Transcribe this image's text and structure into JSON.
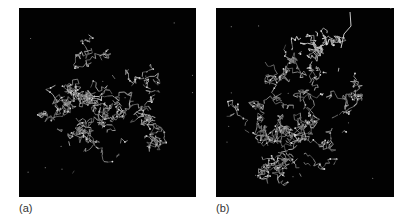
{
  "figure": {
    "background": "#ffffff",
    "panels": [
      {
        "id": "a",
        "label": "(a)",
        "description": "Protein structure stick model, compact globular fold",
        "box": {
          "x": 19,
          "y": 8,
          "w": 177,
          "h": 189
        },
        "label_pos": {
          "x": 19,
          "y": 202
        },
        "blobs": [
          {
            "cx": 85,
            "cy": 100,
            "rx": 70,
            "ry": 78,
            "n": 950,
            "seed": 11
          }
        ],
        "scatter": {
          "n": 14,
          "seed": 5
        }
      },
      {
        "id": "b",
        "label": "(b)",
        "description": "Protein structure stick model with bound ligand/peptide protruding at upper right",
        "box": {
          "x": 216,
          "y": 8,
          "w": 178,
          "h": 189
        },
        "label_pos": {
          "x": 216,
          "y": 202
        },
        "blobs": [
          {
            "cx": 82,
            "cy": 110,
            "rx": 72,
            "ry": 76,
            "n": 950,
            "seed": 23
          },
          {
            "cx": 102,
            "cy": 42,
            "rx": 30,
            "ry": 32,
            "n": 170,
            "seed": 41,
            "bright": true
          }
        ],
        "tail": [
          [
            134,
            4
          ],
          [
            135,
            18
          ],
          [
            128,
            26
          ],
          [
            125,
            40
          ]
        ],
        "scatter": {
          "n": 12,
          "seed": 9
        }
      }
    ],
    "colors": {
      "panel_bg": "#020202",
      "bond": "#9a9a9a",
      "bond_bright": "#c8c8c8",
      "atom": "#e0e0e0"
    }
  }
}
